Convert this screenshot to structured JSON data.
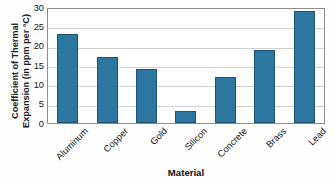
{
  "chart_data": {
    "type": "bar",
    "title": "",
    "subtitle": "",
    "xlabel": "Material",
    "ylabel": "Coefficient of Thermal Expansion (in ppm per °C)",
    "ylabel_line1": "Coefficient of Thermal",
    "ylabel_line2": "Expansion (in ppm per °C)",
    "categories": [
      "Aluminum",
      "Copper",
      "Gold",
      "Silicon",
      "Concrete",
      "Brass",
      "Lead"
    ],
    "values": [
      23,
      17,
      14,
      3,
      12,
      19,
      29
    ],
    "ylim": [
      0,
      30
    ],
    "yticks": [
      30,
      25,
      20,
      15,
      10,
      5,
      0
    ],
    "ytick_labels": [
      "30",
      "25",
      "20",
      "15",
      "10",
      "5",
      "0"
    ],
    "grid": true,
    "grid_axis": "y",
    "legend": false,
    "legend_position": "none",
    "bar_color": "#2d76a0",
    "bar_edge_color": "#1d5374",
    "grid_color": "#d2d2d2",
    "frame_color": "#8e8e8e",
    "background_color": "#ffffff",
    "text_color": "#161616",
    "units": "ppm per °C",
    "xtick_rotation": -45
  }
}
